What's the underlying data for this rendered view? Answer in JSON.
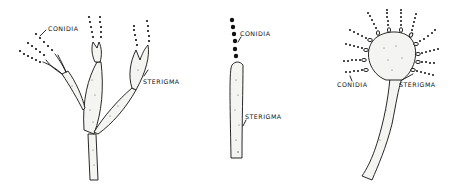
{
  "figures": [
    {
      "id": "penicillium-type",
      "labels": {
        "conidia": "CONIDIA",
        "sterigma": "STERIGMA"
      }
    },
    {
      "id": "single-sterigma",
      "labels": {
        "conidia": "CONIDIA",
        "sterigma": "STERIGMA"
      }
    },
    {
      "id": "aspergillus-type",
      "labels": {
        "conidia": "CONIDIA",
        "sterigma": "STERIGMA"
      }
    }
  ],
  "colors": {
    "ink": "#111111",
    "background": "#ffffff",
    "fill": "#f4f4f2"
  }
}
